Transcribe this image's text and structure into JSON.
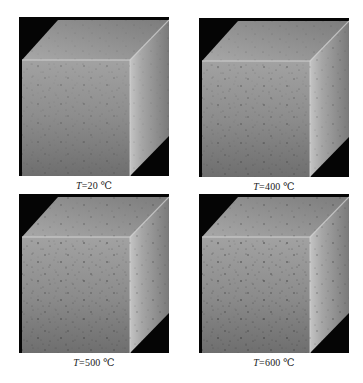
{
  "figure": {
    "panels": [
      {
        "variable": "T",
        "equals": "=",
        "value": "20",
        "unit": "℃",
        "temperature_c": 20
      },
      {
        "variable": "T",
        "equals": "=",
        "value": "400",
        "unit": "℃",
        "temperature_c": 400
      },
      {
        "variable": "T",
        "equals": "=",
        "value": "500",
        "unit": "℃",
        "temperature_c": 500
      },
      {
        "variable": "T",
        "equals": "=",
        "value": "600",
        "unit": "℃",
        "temperature_c": 600
      }
    ],
    "image_description": "3D rendered concrete cube with pores/voids on black background",
    "colors": {
      "background": "#050505",
      "front_face": "#8a8a8a",
      "top_face": "#9c9c9c",
      "side_face": "#b0b0b0",
      "pore": "#3a3a3a"
    }
  }
}
